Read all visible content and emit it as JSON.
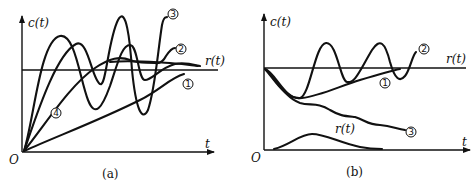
{
  "figure": {
    "panels": [
      {
        "id": "a",
        "caption": "(a)",
        "y_axis_label": "c(t)",
        "x_axis_label": "t",
        "origin_label": "O",
        "reference_label": "r(t)",
        "curves": [
          {
            "id": "1",
            "marker": "①",
            "description": "slow monotonic rise approaching r(t)"
          },
          {
            "id": "2",
            "marker": "②",
            "description": "overdamped-like rise with slight overshoot then rising"
          },
          {
            "id": "3",
            "marker": "③",
            "description": "growing oscillation (unstable)"
          },
          {
            "id": "4",
            "marker": "④",
            "description": "damped oscillation settling to r(t)"
          }
        ]
      },
      {
        "id": "b",
        "caption": "(b)",
        "y_axis_label": "c(t)",
        "x_axis_label": "t",
        "origin_label": "O",
        "reference_label": "r(t)",
        "disturbance_label": "r(t)",
        "curves": [
          {
            "id": "1",
            "marker": "①",
            "description": "dips then recovers toward r(t)"
          },
          {
            "id": "2",
            "marker": "②",
            "description": "dips then oscillates around r(t)"
          },
          {
            "id": "3",
            "marker": "③",
            "description": "dips and keeps drifting downward"
          }
        ]
      }
    ]
  }
}
